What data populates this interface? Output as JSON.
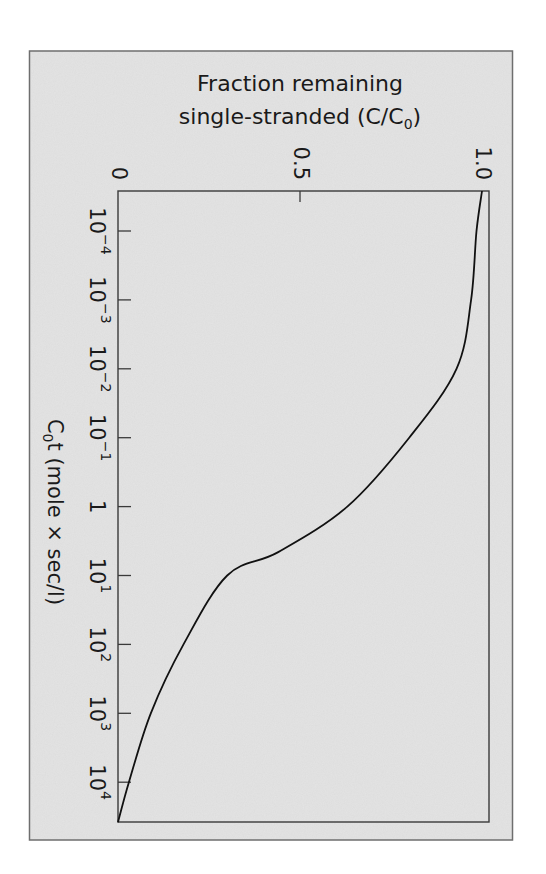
{
  "chart_data": {
    "type": "line",
    "orientation": "rotated-90-clockwise",
    "title": "",
    "ylabel": "Fraction remaining single-stranded (C/C0)",
    "ylabel_lines": [
      "Fraction remaining",
      "single-stranded (C/C",
      "0",
      ")"
    ],
    "xlabel": "C0t (mole × sec/l)",
    "xlabel_parts": [
      "C",
      "0",
      "t (mole × sec/l)"
    ],
    "xscale": "log",
    "xlim": [
      2.6e-05,
      38000
    ],
    "ylim": [
      0,
      1.0
    ],
    "grid": false,
    "legend": null,
    "x_ticks": [
      {
        "base": "10",
        "exp": "−4",
        "log": -4
      },
      {
        "base": "10",
        "exp": "−3",
        "log": -3
      },
      {
        "base": "10",
        "exp": "−2",
        "log": -2
      },
      {
        "base": "10",
        "exp": "−1",
        "log": -1
      },
      {
        "base": "1",
        "exp": "",
        "log": 0
      },
      {
        "base": "10",
        "exp": "1",
        "log": 1
      },
      {
        "base": "10",
        "exp": "2",
        "log": 2
      },
      {
        "base": "10",
        "exp": "3",
        "log": 3
      },
      {
        "base": "10",
        "exp": "4",
        "log": 4
      }
    ],
    "y_ticks": [
      {
        "label": "0",
        "value": 0
      },
      {
        "label": "0.5",
        "value": 0.5
      },
      {
        "label": "1.0",
        "value": 1.0
      }
    ],
    "series": [
      {
        "name": "C/C0",
        "x": [
          2.6e-05,
          0.0001,
          0.001,
          0.01,
          0.1,
          1,
          4.5,
          10,
          100,
          1000,
          10000,
          38000
        ],
        "log_x": [
          -4.58,
          -4,
          -3,
          -2,
          -1,
          0,
          0.66,
          1,
          2,
          3,
          4,
          4.58
        ],
        "values": [
          1.0,
          0.985,
          0.97,
          0.93,
          0.8,
          0.63,
          0.44,
          0.3,
          0.18,
          0.09,
          0.03,
          0.0
        ]
      }
    ]
  },
  "colors": {
    "page_background": "#ffffff",
    "frame_fill": "#e4e4e4",
    "frame_stroke": "#6e6e6e",
    "plot_fill": "#e9e9e9",
    "axis_stroke": "#3a3a3a",
    "curve_stroke": "#111111"
  }
}
